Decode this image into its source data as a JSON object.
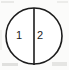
{
  "figure": {
    "name": "divided-circle-diagram",
    "background_color": "#fbfbfa",
    "stroke_color": "#1c1c1c",
    "fill_color": "#ffffff"
  },
  "circle": {
    "center_x": 34,
    "center_y": 36,
    "radius": 28,
    "stroke_width": 1.6
  },
  "divider": {
    "name": "vertical-divider-line",
    "x": 34,
    "y_top": 8,
    "y_bottom": 65,
    "stroke_width": 1.6
  },
  "regions": [
    {
      "id": "left-half",
      "label": "1",
      "label_x": 19,
      "label_y": 36
    },
    {
      "id": "right-half",
      "label": "2",
      "label_x": 40,
      "label_y": 36
    }
  ],
  "chart_data": {
    "type": "pie",
    "title": "",
    "categories": [
      "1",
      "2"
    ],
    "values": [
      50,
      50
    ],
    "labels": [
      "1",
      "2"
    ],
    "legend": "none",
    "grid": false
  }
}
